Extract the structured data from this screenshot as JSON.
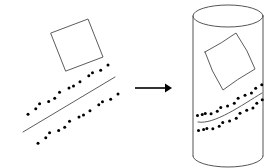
{
  "figure": {
    "title": "Planar pattern wrapped onto a cylinder",
    "background_color": "#ffffff",
    "line_color": "#4a4a4a",
    "dot_color": "#000000",
    "arrow_color": "#000000"
  },
  "left_panel": {
    "name": "flat-pattern",
    "square": {
      "label": "rotated square outline",
      "corners": [
        [
          51,
          33
        ],
        [
          88,
          19
        ],
        [
          103,
          57
        ],
        [
          66,
          71
        ]
      ],
      "closed": true
    },
    "diagonal_line": {
      "label": "straight diagonal line",
      "start": [
        23,
        132
      ],
      "end": [
        115,
        77
      ]
    },
    "dot_rows": [
      {
        "name": "upper-dot-row",
        "count": 13,
        "start": [
          31,
          120
        ],
        "end": [
          110,
          72
        ],
        "offset": [
          -3,
          -7
        ]
      },
      {
        "name": "lower-dot-row",
        "count": 13,
        "start": [
          35,
          135
        ],
        "end": [
          114,
          87
        ],
        "offset": [
          3,
          7
        ]
      }
    ],
    "dot_radius": 1.5
  },
  "arrow": {
    "name": "transform-arrow",
    "label": "maps to",
    "start": [
      135,
      88
    ],
    "end": [
      172,
      88
    ],
    "head_width": 9,
    "head_height": 7
  },
  "right_panel": {
    "name": "cylinder-pattern",
    "cylinder": {
      "label": "vertical cylinder",
      "center_x": 228,
      "top_y": 16,
      "bottom_y": 156,
      "radius_x": 35,
      "radius_y": 11
    },
    "warped_square": {
      "label": "square warped onto cylinder surface",
      "corners": [
        [
          205,
          52
        ],
        [
          236,
          33
        ],
        [
          255,
          69
        ],
        [
          223,
          90
        ]
      ]
    },
    "warped_line": {
      "label": "diagonal line warped onto cylinder surface",
      "start": [
        198,
        122
      ],
      "end": [
        262,
        93
      ]
    },
    "dot_rows": [
      {
        "name": "upper-dot-row-warped",
        "count": 13
      },
      {
        "name": "lower-dot-row-warped",
        "count": 13
      }
    ],
    "dot_radius": 1.5
  }
}
